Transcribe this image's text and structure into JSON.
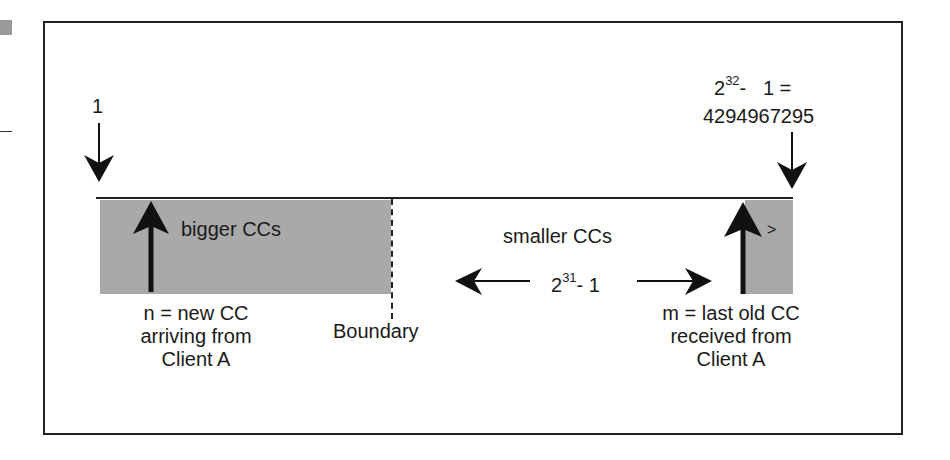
{
  "diagram": {
    "colors": {
      "frame": "#222222",
      "shaded_region": "#a9a9a9",
      "arrow": "#111111",
      "text": "#1a1a1a"
    },
    "start_label": "1",
    "end_label": {
      "base": "2",
      "exponent": "32",
      "rest": "-   1 =",
      "value": "4294967295"
    },
    "left_region": {
      "label": "bigger CCs"
    },
    "right_region": {
      "label": ">"
    },
    "middle": {
      "label": "smaller CCs",
      "span_base": "2",
      "span_exponent": "31",
      "span_rest": "- 1"
    },
    "boundary_label": "Boundary",
    "n_label": [
      "n = new CC",
      "arriving from",
      "Client A"
    ],
    "m_label": [
      "m = last old CC",
      "received from",
      "Client A"
    ]
  }
}
